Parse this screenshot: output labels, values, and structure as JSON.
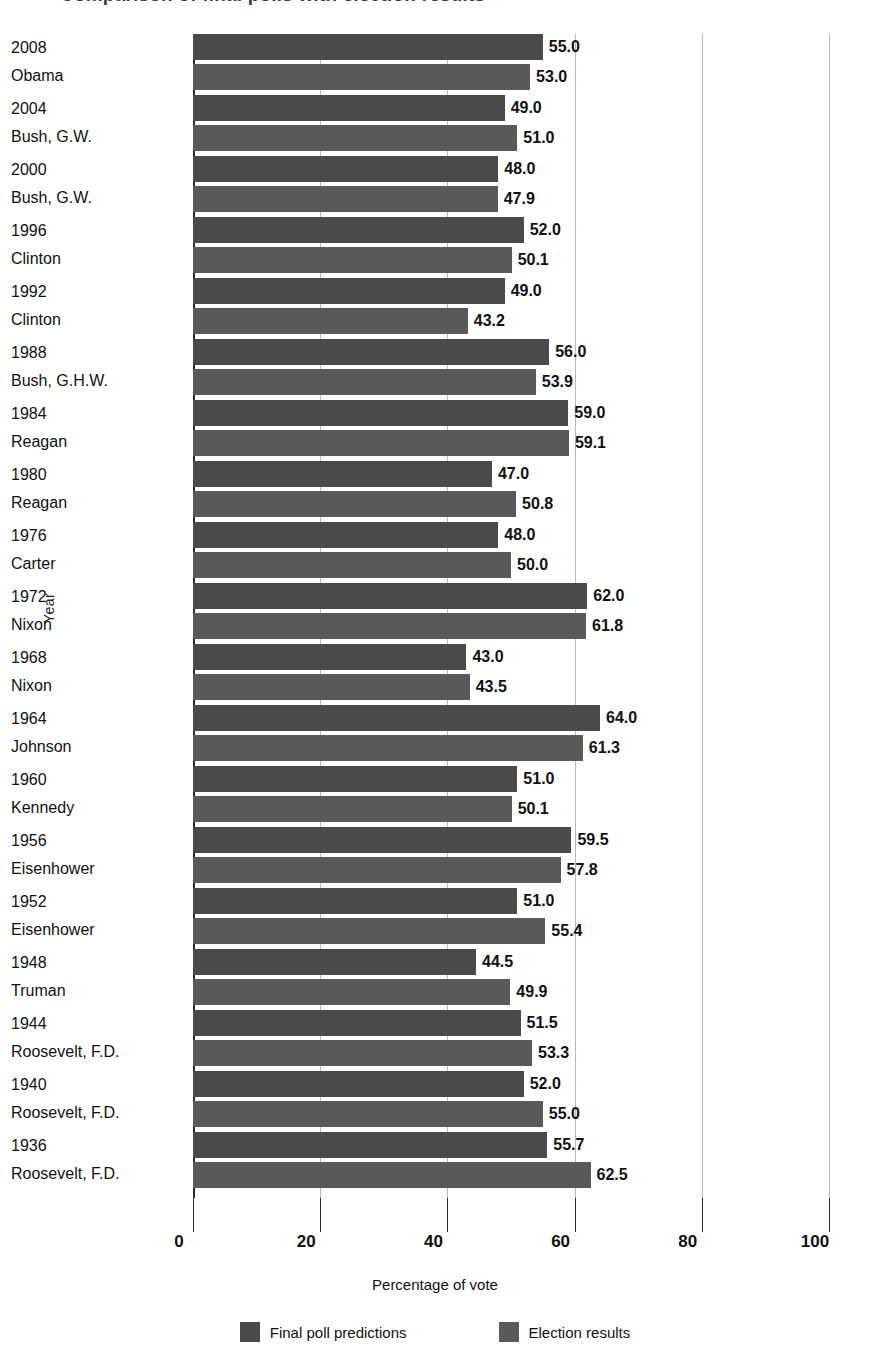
{
  "title_fragment": "Comparison of final polls with election results",
  "axis": {
    "ylabel": "Year",
    "xlabel": "Percentage of vote",
    "xticks": [
      "0",
      "20",
      "40",
      "60",
      "80",
      "100"
    ]
  },
  "legend": {
    "items": [
      {
        "label": "Final poll predictions",
        "color": "#4a4a4a",
        "swatch_name": "legend-swatch-final-poll-predictions"
      },
      {
        "label": "Election results",
        "color": "#595959",
        "swatch_name": "legend-swatch-election-results"
      }
    ]
  },
  "chart_data": {
    "type": "bar",
    "orientation": "horizontal",
    "title": "Comparison of final polls with election results",
    "xlabel": "Percentage of vote",
    "ylabel": "Year",
    "xlim": [
      0,
      100
    ],
    "xticks": [
      0,
      20,
      40,
      60,
      80,
      100
    ],
    "grid": true,
    "legend_position": "bottom",
    "categories": [
      "2008 Obama",
      "2004 Bush, G.W.",
      "2000 Bush, G.W.",
      "1996 Clinton",
      "1992 Clinton",
      "1988 Bush, G.H.W.",
      "1984 Reagan",
      "1980 Reagan",
      "1976 Carter",
      "1972 Nixon",
      "1968 Nixon",
      "1964 Johnson",
      "1960 Kennedy",
      "1956 Eisenhower",
      "1952 Eisenhower",
      "1948 Truman",
      "1944 Roosevelt, F.D.",
      "1940 Roosevelt, F.D.",
      "1936 Roosevelt, F.D."
    ],
    "series": [
      {
        "name": "Final poll predictions",
        "color": "#4a4a4a",
        "values": [
          55.0,
          49.0,
          48.0,
          52.0,
          49.0,
          56.0,
          59.0,
          47.0,
          48.0,
          62.0,
          43.0,
          64.0,
          51.0,
          59.5,
          51.0,
          44.5,
          51.5,
          52.0,
          55.7
        ]
      },
      {
        "name": "Election results",
        "color": "#595959",
        "values": [
          53.0,
          51.0,
          47.9,
          50.1,
          43.2,
          53.9,
          59.1,
          50.8,
          50.0,
          61.8,
          43.5,
          61.3,
          50.1,
          57.8,
          55.4,
          49.9,
          53.3,
          55.0,
          62.5
        ]
      }
    ]
  },
  "rows": [
    {
      "year": "2008",
      "person": "Obama",
      "pred": "55.0",
      "result": "53.0",
      "pred_v": 55.0,
      "result_v": 53.0
    },
    {
      "year": "2004",
      "person": "Bush, G.W.",
      "pred": "49.0",
      "result": "51.0",
      "pred_v": 49.0,
      "result_v": 51.0
    },
    {
      "year": "2000",
      "person": "Bush, G.W.",
      "pred": "48.0",
      "result": "47.9",
      "pred_v": 48.0,
      "result_v": 47.9
    },
    {
      "year": "1996",
      "person": "Clinton",
      "pred": "52.0",
      "result": "50.1",
      "pred_v": 52.0,
      "result_v": 50.1
    },
    {
      "year": "1992",
      "person": "Clinton",
      "pred": "49.0",
      "result": "43.2",
      "pred_v": 49.0,
      "result_v": 43.2
    },
    {
      "year": "1988",
      "person": "Bush, G.H.W.",
      "pred": "56.0",
      "result": "53.9",
      "pred_v": 56.0,
      "result_v": 53.9
    },
    {
      "year": "1984",
      "person": "Reagan",
      "pred": "59.0",
      "result": "59.1",
      "pred_v": 59.0,
      "result_v": 59.1
    },
    {
      "year": "1980",
      "person": "Reagan",
      "pred": "47.0",
      "result": "50.8",
      "pred_v": 47.0,
      "result_v": 50.8
    },
    {
      "year": "1976",
      "person": "Carter",
      "pred": "48.0",
      "result": "50.0",
      "pred_v": 48.0,
      "result_v": 50.0
    },
    {
      "year": "1972",
      "person": "Nixon",
      "pred": "62.0",
      "result": "61.8",
      "pred_v": 62.0,
      "result_v": 61.8
    },
    {
      "year": "1968",
      "person": "Nixon",
      "pred": "43.0",
      "result": "43.5",
      "pred_v": 43.0,
      "result_v": 43.5
    },
    {
      "year": "1964",
      "person": "Johnson",
      "pred": "64.0",
      "result": "61.3",
      "pred_v": 64.0,
      "result_v": 61.3
    },
    {
      "year": "1960",
      "person": "Kennedy",
      "pred": "51.0",
      "result": "50.1",
      "pred_v": 51.0,
      "result_v": 50.1
    },
    {
      "year": "1956",
      "person": "Eisenhower",
      "pred": "59.5",
      "result": "57.8",
      "pred_v": 59.5,
      "result_v": 57.8
    },
    {
      "year": "1952",
      "person": "Eisenhower",
      "pred": "51.0",
      "result": "55.4",
      "pred_v": 51.0,
      "result_v": 55.4
    },
    {
      "year": "1948",
      "person": "Truman",
      "pred": "44.5",
      "result": "49.9",
      "pred_v": 44.5,
      "result_v": 49.9
    },
    {
      "year": "1944",
      "person": "Roosevelt, F.D.",
      "pred": "51.5",
      "result": "53.3",
      "pred_v": 51.5,
      "result_v": 53.3
    },
    {
      "year": "1940",
      "person": "Roosevelt, F.D.",
      "pred": "52.0",
      "result": "55.0",
      "pred_v": 52.0,
      "result_v": 55.0
    },
    {
      "year": "1936",
      "person": "Roosevelt, F.D.",
      "pred": "55.7",
      "result": "62.5",
      "pred_v": 55.7,
      "result_v": 62.5
    }
  ]
}
